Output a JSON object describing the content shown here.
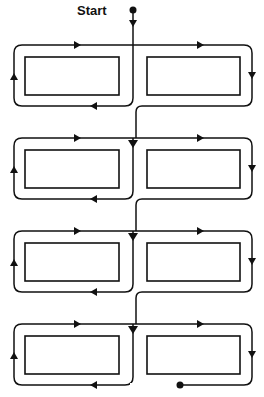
{
  "diagram": {
    "title": "",
    "start_label": "Start",
    "stroke_color": "#111111",
    "background": "#ffffff",
    "rows": [
      {
        "id": 1,
        "boxes": [
          "left",
          "right"
        ],
        "path": "start-down-center, loop-right-box clockwise, loop-left-box counter..."
      },
      {
        "id": 2,
        "boxes": [
          "left",
          "right"
        ]
      },
      {
        "id": 3,
        "boxes": [
          "left",
          "right"
        ]
      },
      {
        "id": 4,
        "boxes": [
          "left",
          "right"
        ],
        "end": "dot"
      }
    ],
    "nodes": {
      "start": "Start dot",
      "end": "End dot"
    }
  }
}
